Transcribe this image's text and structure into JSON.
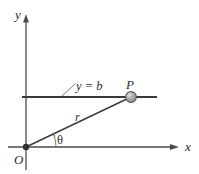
{
  "figure": {
    "type": "polar-coordinate-diagram",
    "background_color": "#ffffff",
    "stroke_color": "#3a3a3a",
    "label_color": "#2b2b2b",
    "point_fill_color": "#a8a8a8",
    "point_stroke_color": "#4a4a4a",
    "axes": {
      "x_axis_label": "x",
      "y_axis_label": "y",
      "origin_label": "O"
    },
    "labels": {
      "line_equation": "y = b",
      "radius": "r",
      "angle": "θ",
      "point": "P"
    },
    "geometry": {
      "origin": [
        26,
        147
      ],
      "point_P": [
        131,
        97
      ],
      "x_axis_start": [
        8,
        147
      ],
      "x_axis_end": [
        178,
        147
      ],
      "y_axis_top": [
        26,
        15
      ],
      "y_axis_bottom": [
        26,
        170
      ],
      "horizontal_line_start": [
        22,
        97
      ],
      "horizontal_line_end": [
        157,
        97
      ],
      "leader_line_start": [
        62,
        97
      ],
      "leader_line_end": [
        75,
        84
      ],
      "point_radius": 5.2,
      "angle_arc_radius": 30
    }
  }
}
